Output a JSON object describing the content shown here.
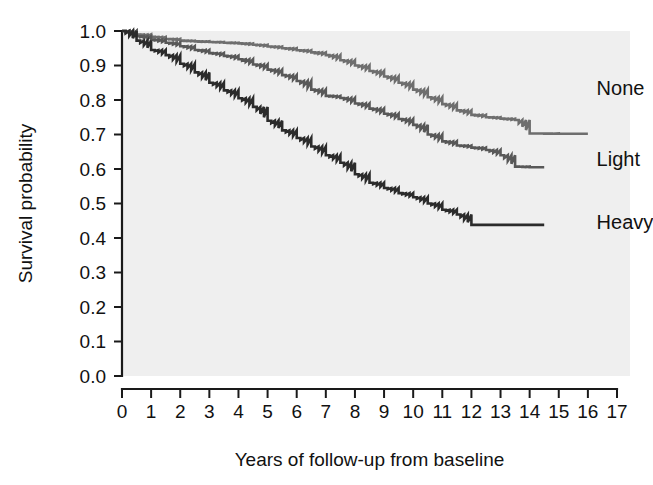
{
  "chart_data": {
    "type": "line",
    "title": "",
    "subtitle": "",
    "xlabel": "Years of follow-up from baseline",
    "ylabel": "Survival probability",
    "xlim": [
      0,
      17
    ],
    "ylim": [
      0.0,
      1.0
    ],
    "grid": false,
    "legend_position": "right-inline-labels",
    "x_ticks": [
      "0",
      "1",
      "2",
      "3",
      "4",
      "5",
      "6",
      "7",
      "8",
      "9",
      "10",
      "11",
      "12",
      "13",
      "14",
      "15",
      "16",
      "17"
    ],
    "x_tick_values": [
      0,
      1,
      2,
      3,
      4,
      5,
      6,
      7,
      8,
      9,
      10,
      11,
      12,
      13,
      14,
      15,
      16,
      17
    ],
    "y_ticks": [
      "0.0",
      "0.1",
      "0.2",
      "0.3",
      "0.4",
      "0.5",
      "0.6",
      "0.7",
      "0.8",
      "0.9",
      "1.0"
    ],
    "y_tick_values": [
      0.0,
      0.1,
      0.2,
      0.3,
      0.4,
      0.5,
      0.6,
      0.7,
      0.8,
      0.9,
      1.0
    ],
    "step_style": "step-post",
    "series": [
      {
        "name": "None",
        "color": "#6e6e6e",
        "label_x": 16.3,
        "label_y": 0.815,
        "x": [
          0,
          0.5,
          1.0,
          1.5,
          2.0,
          2.5,
          3.0,
          3.5,
          4.0,
          4.5,
          5.0,
          5.5,
          6.0,
          6.5,
          7.0,
          7.5,
          8.0,
          8.5,
          9.0,
          9.5,
          10.0,
          10.5,
          11.0,
          11.5,
          12.0,
          12.5,
          13.0,
          13.5,
          14.0,
          15.0,
          16.0
        ],
        "y": [
          1.0,
          0.99,
          0.983,
          0.977,
          0.972,
          0.97,
          0.968,
          0.966,
          0.964,
          0.96,
          0.955,
          0.95,
          0.944,
          0.938,
          0.93,
          0.915,
          0.9,
          0.884,
          0.868,
          0.85,
          0.83,
          0.808,
          0.788,
          0.77,
          0.757,
          0.75,
          0.746,
          0.742,
          0.703,
          0.702,
          0.702
        ]
      },
      {
        "name": "Light",
        "color": "#585858",
        "label_x": 16.3,
        "label_y": 0.608,
        "x": [
          0,
          0.5,
          1.0,
          1.5,
          2.0,
          2.5,
          3.0,
          3.5,
          4.0,
          4.5,
          5.0,
          5.5,
          6.0,
          6.5,
          7.0,
          7.5,
          8.0,
          8.5,
          9.0,
          9.5,
          10.0,
          10.5,
          11.0,
          11.5,
          12.0,
          12.5,
          13.0,
          13.5,
          14.0,
          14.5
        ],
        "y": [
          1.0,
          0.985,
          0.975,
          0.966,
          0.956,
          0.945,
          0.936,
          0.928,
          0.918,
          0.903,
          0.888,
          0.872,
          0.855,
          0.83,
          0.812,
          0.806,
          0.79,
          0.775,
          0.76,
          0.745,
          0.728,
          0.7,
          0.68,
          0.668,
          0.662,
          0.655,
          0.64,
          0.607,
          0.605,
          0.605
        ]
      },
      {
        "name": "Heavy",
        "color": "#2b2b2b",
        "label_x": 16.3,
        "label_y": 0.425,
        "x": [
          0,
          0.5,
          1.0,
          1.5,
          2.0,
          2.5,
          3.0,
          3.5,
          4.0,
          4.5,
          5.0,
          5.5,
          6.0,
          6.5,
          7.0,
          7.5,
          8.0,
          8.5,
          9.0,
          9.5,
          10.0,
          10.5,
          11.0,
          11.5,
          12.0,
          12.5,
          13.0,
          13.5,
          14.0,
          14.5
        ],
        "y": [
          1.0,
          0.972,
          0.945,
          0.93,
          0.905,
          0.88,
          0.85,
          0.828,
          0.805,
          0.78,
          0.74,
          0.712,
          0.69,
          0.665,
          0.64,
          0.618,
          0.585,
          0.56,
          0.545,
          0.53,
          0.518,
          0.5,
          0.482,
          0.468,
          0.438,
          0.438,
          0.438,
          0.438,
          0.438,
          0.438
        ]
      }
    ]
  },
  "colors": {
    "plot_background": "#efefef",
    "page_background": "#ffffff",
    "axis": "#1a1a1a",
    "text": "#111111"
  }
}
